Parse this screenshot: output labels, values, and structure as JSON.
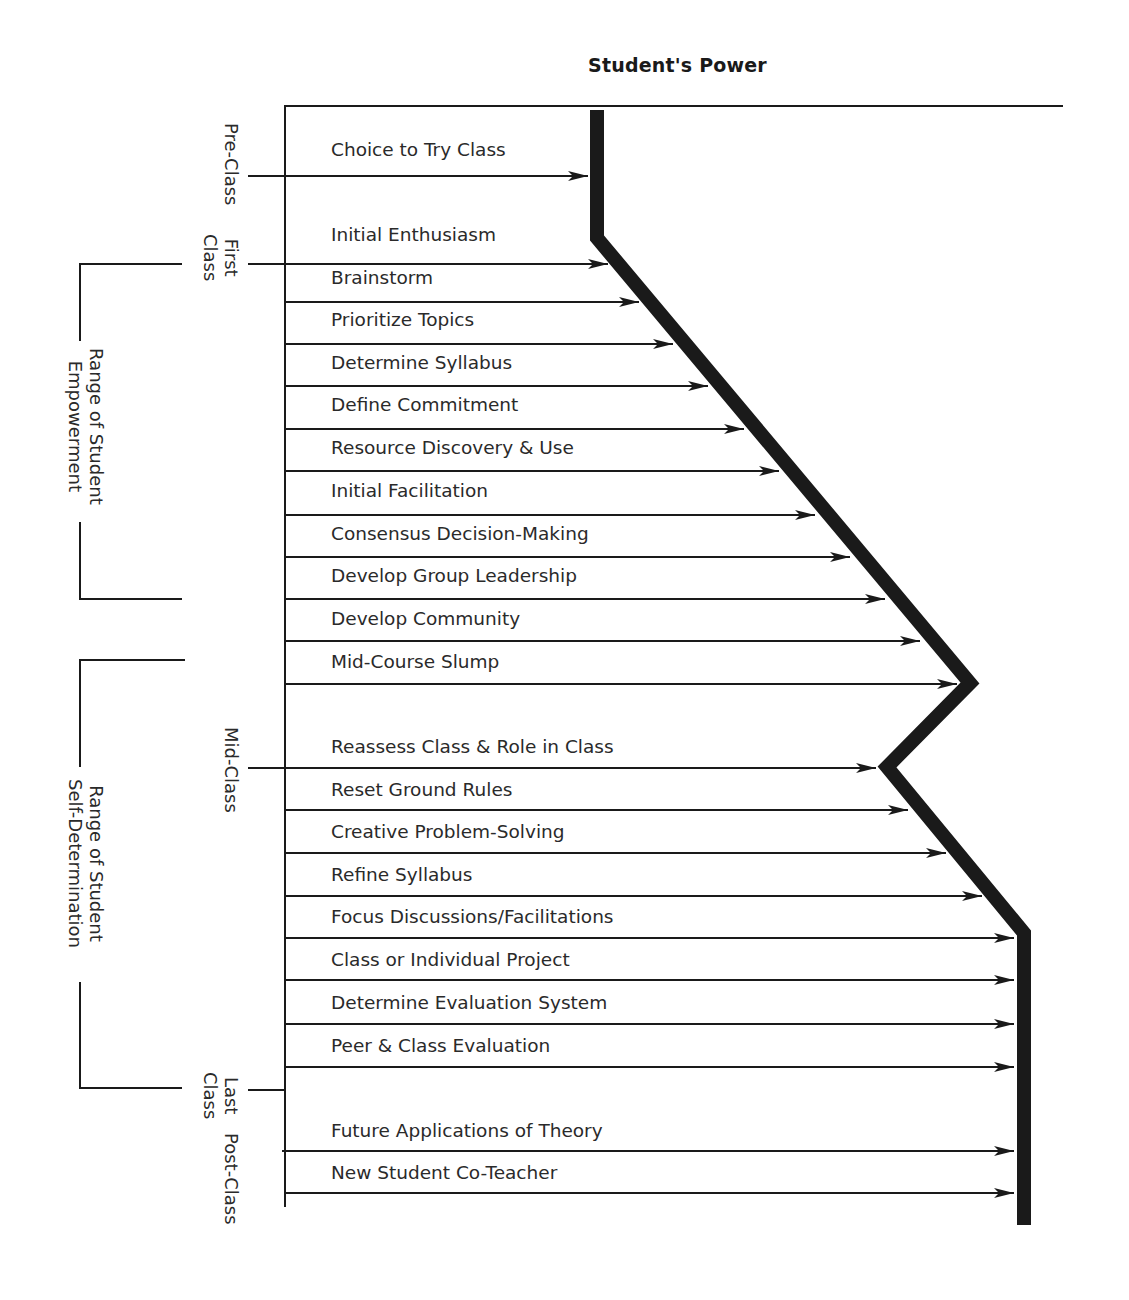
{
  "title": "Student's Power",
  "phases": [
    {
      "label": "Pre-Class",
      "y": 176
    },
    {
      "label": "First\nClass",
      "line1": "First",
      "line2": "Class",
      "y": 264
    },
    {
      "label": "Mid-Class",
      "y": 768
    },
    {
      "label": "Last\nClass",
      "line1": "Last",
      "line2": "Class",
      "y": 1090
    },
    {
      "label": "Post-Class",
      "y": 1151
    }
  ],
  "ranges": [
    {
      "line1": "Range of Student",
      "line2": "Empowerment",
      "top": 264,
      "bottom": 599
    },
    {
      "line1": "Range of Student",
      "line2": "Self-Determination",
      "top": 660,
      "bottom": 1090
    }
  ],
  "steps": [
    {
      "label": "Choice to Try Class",
      "text_y": 151,
      "arrow_y": 176,
      "arrow_start": 248,
      "tip": 588
    },
    {
      "label": "Initial Enthusiasm",
      "text_y": 236,
      "arrow_y": 264,
      "arrow_start": 248,
      "tip": 608
    },
    {
      "label": "Brainstorm",
      "text_y": 279,
      "arrow_y": 302,
      "arrow_start": 285,
      "tip": 639
    },
    {
      "label": "Prioritize Topics",
      "text_y": 321,
      "arrow_y": 344,
      "arrow_start": 285,
      "tip": 673
    },
    {
      "label": "Determine Syllabus",
      "text_y": 364,
      "arrow_y": 386,
      "arrow_start": 285,
      "tip": 708
    },
    {
      "label": "Define Commitment",
      "text_y": 406,
      "arrow_y": 429,
      "arrow_start": 285,
      "tip": 744
    },
    {
      "label": "Resource Discovery & Use",
      "text_y": 449,
      "arrow_y": 471,
      "arrow_start": 285,
      "tip": 779
    },
    {
      "label": "Initial Facilitation",
      "text_y": 492,
      "arrow_y": 515,
      "arrow_start": 285,
      "tip": 815
    },
    {
      "label": "Consensus Decision-Making",
      "text_y": 535,
      "arrow_y": 557,
      "arrow_start": 285,
      "tip": 850
    },
    {
      "label": "Develop Group Leadership",
      "text_y": 577,
      "arrow_y": 599,
      "arrow_start": 285,
      "tip": 885
    },
    {
      "label": "Develop Community",
      "text_y": 620,
      "arrow_y": 641,
      "arrow_start": 285,
      "tip": 920
    },
    {
      "label": "Mid-Course Slump",
      "text_y": 663,
      "arrow_y": 684,
      "arrow_start": 285,
      "tip": 957
    },
    {
      "label": "Reassess Class & Role in Class",
      "text_y": 748,
      "arrow_y": 768,
      "arrow_start": 248,
      "tip": 876
    },
    {
      "label": "Reset Ground Rules",
      "text_y": 791,
      "arrow_y": 810,
      "arrow_start": 285,
      "tip": 908
    },
    {
      "label": "Creative Problem-Solving",
      "text_y": 833,
      "arrow_y": 853,
      "arrow_start": 285,
      "tip": 946
    },
    {
      "label": "Refine Syllabus",
      "text_y": 876,
      "arrow_y": 896,
      "arrow_start": 285,
      "tip": 982
    },
    {
      "label": "Focus Discussions/Facilitations",
      "text_y": 918,
      "arrow_y": 938,
      "arrow_start": 285,
      "tip": 1014
    },
    {
      "label": "Class or Individual Project",
      "text_y": 961,
      "arrow_y": 980,
      "arrow_start": 285,
      "tip": 1014
    },
    {
      "label": "Determine Evaluation System",
      "text_y": 1004,
      "arrow_y": 1024,
      "arrow_start": 285,
      "tip": 1014
    },
    {
      "label": "Peer & Class Evaluation",
      "text_y": 1047,
      "arrow_y": 1067,
      "arrow_start": 285,
      "tip": 1014
    },
    {
      "label": "Future Applications of Theory",
      "text_y": 1132,
      "arrow_y": 1151,
      "arrow_start": 282,
      "tip": 1014
    },
    {
      "label": "New Student Co-Teacher",
      "text_y": 1174,
      "arrow_y": 1193,
      "arrow_start": 285,
      "tip": 1014
    }
  ],
  "power_line": [
    [
      597,
      110
    ],
    [
      597,
      238
    ],
    [
      970,
      683
    ],
    [
      887,
      767
    ],
    [
      1024,
      933
    ],
    [
      1024,
      1225
    ]
  ],
  "colors": {
    "ink": "#1a1a1a",
    "text": "#2a2a2a",
    "background": "#ffffff"
  }
}
